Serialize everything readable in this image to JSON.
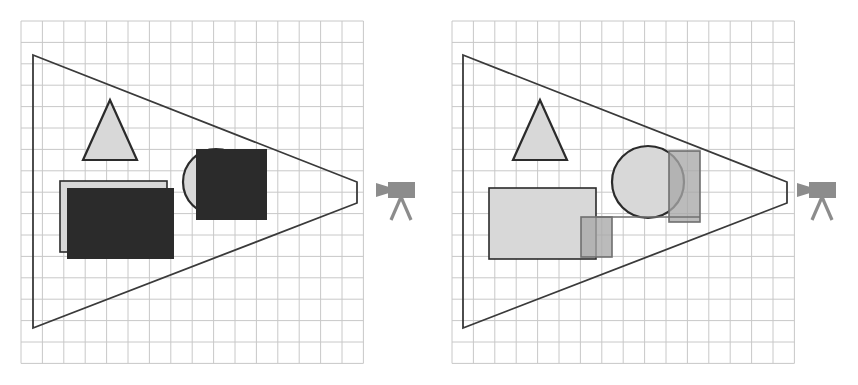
{
  "figure": {
    "panel_count": 2,
    "background_color": "#ffffff",
    "grid_color": "#c8c8c8",
    "outline_color": "#3a3a3a",
    "dark_fill_color": "#2b2b2b",
    "light_fill_color": "#d8d8d8",
    "mid_fill_color": "#a8a8a8",
    "camera_color": "#8c8c8c"
  },
  "panels": [
    {
      "id": "left",
      "name": "occluded-view",
      "grid": {
        "x": 21,
        "y": 21,
        "width": 342,
        "height": 347,
        "cell": 21.4
      },
      "frustum": {
        "name": "camera-frustum",
        "points": "33,55 357,182 357,203 33,328",
        "stroke": "#3a3a3a",
        "fill": "none"
      },
      "camera": {
        "x": 376,
        "y": 180,
        "width": 40,
        "height": 44
      },
      "shapes": [
        {
          "name": "triangle",
          "type": "triangle",
          "fill": "#d8d8d8",
          "stroke": "#2b2b2b",
          "points": "110,100 137,160 83,160"
        },
        {
          "name": "circle",
          "type": "circle",
          "fill": "#d8d8d8",
          "stroke": "#2b2b2b",
          "cx": 216,
          "cy": 182,
          "r": 33
        },
        {
          "name": "circle-square",
          "type": "rect",
          "fill": "#2b2b2b",
          "stroke": "none",
          "x": 196,
          "y": 149,
          "width": 71,
          "height": 71
        },
        {
          "name": "outline-rectangle",
          "type": "rect",
          "fill": "#d8d8d8",
          "stroke": "#2b2b2b",
          "x": 60,
          "y": 181,
          "width": 107,
          "height": 71
        },
        {
          "name": "dark-rectangle",
          "type": "rect",
          "fill": "#2b2b2b",
          "stroke": "none",
          "x": 67,
          "y": 188,
          "width": 107,
          "height": 71
        }
      ]
    },
    {
      "id": "right",
      "name": "transparent-view",
      "grid": {
        "x": 452,
        "y": 21,
        "width": 342,
        "height": 347,
        "cell": 21.4
      },
      "frustum": {
        "name": "camera-frustum",
        "points": "463,55 787,182 787,203 463,328",
        "stroke": "#3a3a3a",
        "fill": "none"
      },
      "camera": {
        "x": 797,
        "y": 180,
        "width": 40,
        "height": 44
      },
      "shapes": [
        {
          "name": "triangle",
          "type": "triangle",
          "fill": "#d8d8d8",
          "stroke": "#2b2b2b",
          "points": "540,100 567,160 513,160"
        },
        {
          "name": "circle",
          "type": "circle",
          "fill": "#d8d8d8",
          "stroke": "#2b2b2b",
          "cx": 648,
          "cy": 182,
          "r": 36
        },
        {
          "name": "circle-square",
          "type": "rect",
          "fill": "#a8a8a8",
          "stroke": "#6f6f6f",
          "x": 669,
          "y": 151,
          "width": 31,
          "height": 71
        },
        {
          "name": "outline-rectangle",
          "type": "rect",
          "fill": "#d8d8d8",
          "stroke": "#2b2b2b",
          "x": 489,
          "y": 188,
          "width": 107,
          "height": 71
        },
        {
          "name": "small-square",
          "type": "rect",
          "fill": "#a8a8a8",
          "stroke": "#6f6f6f",
          "x": 581,
          "y": 217,
          "width": 31,
          "height": 40
        },
        {
          "name": "connector-line",
          "type": "line",
          "stroke": "#6f6f6f",
          "x1": 596,
          "y1": 217,
          "x2": 700,
          "y2": 217
        }
      ]
    }
  ],
  "camera_icon": {
    "name": "camera-icon",
    "parts": [
      "lens-triangle",
      "body-rectangle",
      "tripod-legs"
    ],
    "color": "#8c8c8c"
  }
}
